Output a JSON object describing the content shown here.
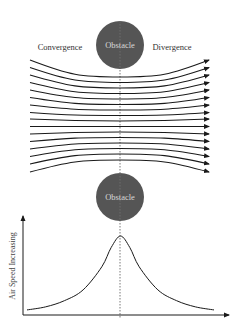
{
  "diagram": {
    "labels": {
      "convergence": "Convergence",
      "divergence": "Divergence",
      "obstacle_top": "Obstacle",
      "obstacle_bottom": "Obstacle",
      "y_axis": "Air Speed Increasing"
    },
    "colors": {
      "background": "#ffffff",
      "obstacle_fill": "#555555",
      "obstacle_text": "#d8d8d8",
      "streamline": "#1a1a1a",
      "label_text": "#333333",
      "center_line": "#555555"
    },
    "obstacles": [
      {
        "id": "top",
        "cx": 120,
        "cy": 45,
        "r": 24
      },
      {
        "id": "bottom",
        "cx": 120,
        "cy": 197,
        "r": 24
      }
    ],
    "streamlines": {
      "count": 16,
      "x_start": 30,
      "x_end": 209,
      "center_x": 120,
      "left_y": [
        60,
        67.5,
        75,
        82.5,
        90,
        97.5,
        105,
        112.5,
        119,
        126.5,
        134,
        141.5,
        149,
        156.5,
        164,
        172
      ],
      "mid_y": [
        77,
        82.5,
        88,
        93.5,
        99,
        104.5,
        110,
        115.5,
        121,
        126.5,
        132,
        137.5,
        143,
        148.5,
        154,
        160
      ]
    }
  },
  "chart_data": {
    "type": "line",
    "title": "",
    "xlabel": "",
    "ylabel": "Air Speed Increasing",
    "series": [
      {
        "name": "Air speed profile",
        "x": [
          0,
          0.1,
          0.2,
          0.3,
          0.4,
          0.45,
          0.5,
          0.55,
          0.6,
          0.7,
          0.8,
          0.9,
          1.0
        ],
        "values": [
          0.04,
          0.08,
          0.16,
          0.3,
          0.6,
          0.85,
          1.0,
          0.85,
          0.6,
          0.3,
          0.16,
          0.08,
          0.04
        ]
      }
    ],
    "peak_at": "center (obstacle position)",
    "grid": false,
    "legend": "none"
  }
}
